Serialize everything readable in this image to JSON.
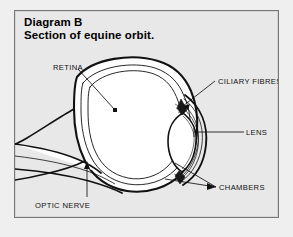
{
  "figure": {
    "title_line1": "Diagram B",
    "title_line2": "Section of equine orbit.",
    "colors": {
      "page_background": "#efefef",
      "panel_background": "#e8e8e8",
      "panel_border": "#767676",
      "ink": "#111111",
      "fill": "#ffffff"
    }
  },
  "labels": {
    "retina": "RETINA",
    "ciliary_fibres": "CILIARY FIBRES",
    "lens": "LENS",
    "chambers": "CHAMBERS",
    "optic_nerve": "OPTIC NERVE"
  }
}
